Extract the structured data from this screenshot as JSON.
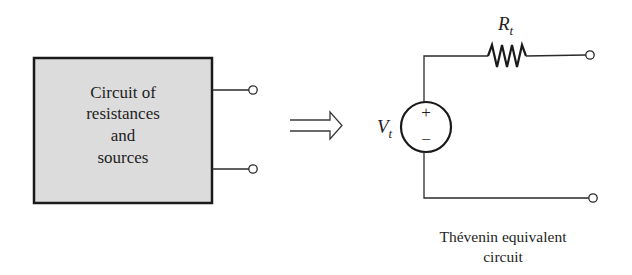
{
  "diagram": {
    "type": "circuit-equivalence",
    "original_circuit": {
      "label_lines": [
        "Circuit of",
        "resistances",
        "and",
        "sources"
      ],
      "fill_color": "#dcdcdc",
      "border_color": "#1a1a1a",
      "terminals": 2
    },
    "arrow": {
      "symbol": "double-arrow-right",
      "meaning": "is equivalent to"
    },
    "equivalent_circuit": {
      "source_label": "V",
      "source_subscript": "t",
      "source_polarity_plus": "+",
      "source_polarity_minus": "−",
      "resistor_label": "R",
      "resistor_subscript": "t",
      "terminals": 2,
      "caption_lines": [
        "Thévenin equivalent",
        "circuit"
      ]
    },
    "colors": {
      "line": "#2a2a2a",
      "text": "#1e1e1e",
      "box_fill": "#dcdcdc",
      "background": "#ffffff"
    }
  }
}
